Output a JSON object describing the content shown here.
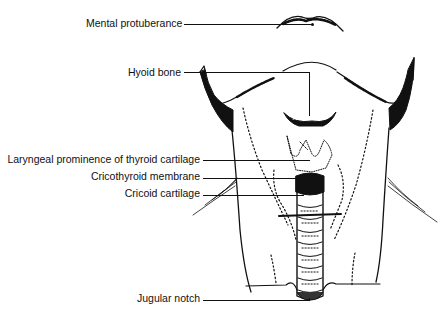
{
  "diagram": {
    "type": "anatomical-illustration",
    "labels": [
      {
        "id": "mental-protuberance",
        "text": "Mental protuberance"
      },
      {
        "id": "hyoid-bone",
        "text": "Hyoid bone"
      },
      {
        "id": "laryngeal-prominence",
        "text": "Laryngeal prominence of thyroid cartilage"
      },
      {
        "id": "cricothyroid-membrane",
        "text": "Cricothyroid membrane"
      },
      {
        "id": "cricoid-cartilage",
        "text": "Cricoid cartilage"
      },
      {
        "id": "jugular-notch",
        "text": "Jugular notch"
      }
    ],
    "colors": {
      "ink": "#111111",
      "background": "#ffffff"
    }
  }
}
